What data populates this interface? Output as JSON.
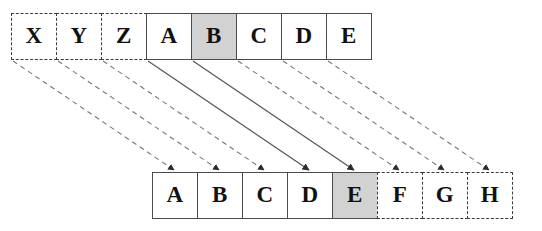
{
  "diagram": {
    "colors": {
      "cell_border": "#4a4a4a",
      "cell_fill": "#ffffff",
      "shaded_fill": "#d2d2d2",
      "solid_arrow": "#555555",
      "dashed_arrow": "#777777",
      "text": "#111111"
    },
    "top_row": {
      "name": "source-row",
      "cells": [
        {
          "label": "X",
          "style": "dashed",
          "shaded": false
        },
        {
          "label": "Y",
          "style": "dashed",
          "shaded": false
        },
        {
          "label": "Z",
          "style": "dashed",
          "shaded": false
        },
        {
          "label": "A",
          "style": "solid",
          "shaded": false
        },
        {
          "label": "B",
          "style": "solid",
          "shaded": true
        },
        {
          "label": "C",
          "style": "solid",
          "shaded": false
        },
        {
          "label": "D",
          "style": "solid",
          "shaded": false
        },
        {
          "label": "E",
          "style": "solid",
          "shaded": false
        }
      ]
    },
    "bottom_row": {
      "name": "destination-row",
      "cells": [
        {
          "label": "A",
          "style": "solid",
          "shaded": false
        },
        {
          "label": "B",
          "style": "solid",
          "shaded": false
        },
        {
          "label": "C",
          "style": "solid",
          "shaded": false
        },
        {
          "label": "D",
          "style": "solid",
          "shaded": false
        },
        {
          "label": "E",
          "style": "solid",
          "shaded": true
        },
        {
          "label": "F",
          "style": "dashed",
          "shaded": false
        },
        {
          "label": "G",
          "style": "dashed",
          "shaded": false
        },
        {
          "label": "H",
          "style": "dashed",
          "shaded": false
        }
      ]
    },
    "arrows": [
      {
        "from": "X",
        "to": "A",
        "style": "dashed"
      },
      {
        "from": "Y",
        "to": "B",
        "style": "dashed"
      },
      {
        "from": "Z",
        "to": "C",
        "style": "dashed"
      },
      {
        "from": "A",
        "to": "D",
        "style": "solid"
      },
      {
        "from": "B",
        "to": "E",
        "style": "solid"
      },
      {
        "from": "C",
        "to": "F",
        "style": "dashed"
      },
      {
        "from": "D",
        "to": "G",
        "style": "dashed"
      },
      {
        "from": "E",
        "to": "H",
        "style": "dashed"
      }
    ]
  }
}
